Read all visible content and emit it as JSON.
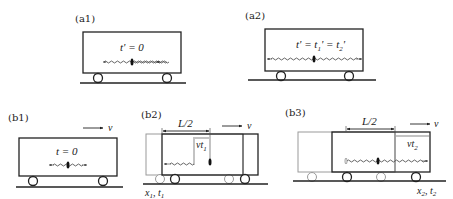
{
  "panels": {
    "a1": {
      "label": "(a1)",
      "time": "t' = 0"
    },
    "a2": {
      "label": "(a2)",
      "time_t": "t' = t",
      "time_sub1": "1",
      "time_mid": "' = t",
      "time_sub2": "2",
      "time_end": "'"
    },
    "b1": {
      "label": "(b1)",
      "time": "t = 0",
      "velocity": "v"
    },
    "b2": {
      "label": "(b2)",
      "half_length": "L/2",
      "velocity": "v",
      "displacement": "vt",
      "displacement_sub": "1",
      "position": "x",
      "position_sub": "1",
      "time_sep": ", t",
      "time_sub": "1"
    },
    "b3": {
      "label": "(b3)",
      "half_length": "L/2",
      "velocity": "v",
      "displacement": "vt",
      "displacement_sub": "2",
      "position": "x",
      "position_sub": "2",
      "time_sep": ", t",
      "time_sub": "2"
    }
  },
  "colors": {
    "ink": "#222222",
    "ghost": "#9a9a9a",
    "background": "#ffffff"
  }
}
